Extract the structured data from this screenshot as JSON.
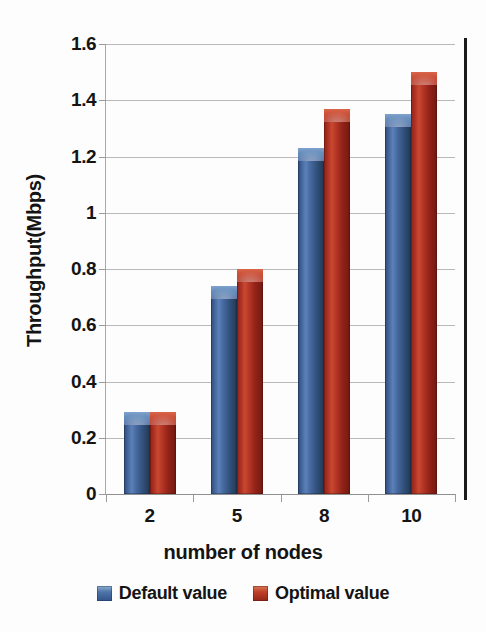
{
  "chart_data": {
    "type": "bar",
    "title": "",
    "subtitle": "",
    "xlabel": "number of nodes",
    "ylabel": "Throughput(Mbps)",
    "categories": [
      "2",
      "5",
      "8",
      "10"
    ],
    "series": [
      {
        "name": "Default value",
        "color": "#3f6098",
        "values": [
          0.29,
          0.74,
          1.23,
          1.35
        ]
      },
      {
        "name": "Optimal value",
        "color": "#b8372a",
        "values": [
          0.29,
          0.8,
          1.37,
          1.5
        ]
      }
    ],
    "ylim": [
      0,
      1.6
    ],
    "ytick_labels": [
      "0",
      "0.2",
      "0.4",
      "0.6",
      "0.8",
      "1",
      "1.2",
      "1.4",
      "1.6"
    ],
    "ytick_values": [
      0,
      0.2,
      0.4,
      0.6,
      0.8,
      1,
      1.2,
      1.4,
      1.6
    ],
    "grid": "horizontal",
    "legend_position": "bottom",
    "bar_style": "3d-gradient-cylinder"
  },
  "legend": {
    "items": [
      {
        "label": "Default value",
        "swatch": "blue"
      },
      {
        "label": "Optimal value",
        "swatch": "red"
      }
    ]
  },
  "axes": {
    "y_title": "Throughput(Mbps)",
    "x_title": "number of nodes"
  }
}
